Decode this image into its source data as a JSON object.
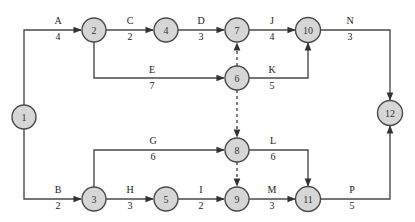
{
  "diagram": {
    "type": "activity-on-arrow network",
    "colors": {
      "node_fill": "#d6d6d6",
      "stroke": "#4a4a4a",
      "text": "#222222"
    },
    "nodes": [
      {
        "id": "1",
        "label": "1",
        "x": 24,
        "y": 117
      },
      {
        "id": "2",
        "label": "2",
        "x": 94,
        "y": 30
      },
      {
        "id": "3",
        "label": "3",
        "x": 94,
        "y": 199
      },
      {
        "id": "4",
        "label": "4",
        "x": 166,
        "y": 30
      },
      {
        "id": "5",
        "label": "5",
        "x": 166,
        "y": 199
      },
      {
        "id": "6",
        "label": "6",
        "x": 237,
        "y": 78
      },
      {
        "id": "7",
        "label": "7",
        "x": 237,
        "y": 30
      },
      {
        "id": "8",
        "label": "8",
        "x": 237,
        "y": 150
      },
      {
        "id": "9",
        "label": "9",
        "x": 237,
        "y": 199
      },
      {
        "id": "10",
        "label": "10",
        "x": 308,
        "y": 30
      },
      {
        "id": "11",
        "label": "11",
        "x": 308,
        "y": 199
      },
      {
        "id": "12",
        "label": "12",
        "x": 390,
        "y": 113
      }
    ],
    "activities": [
      {
        "name": "A",
        "duration": "4",
        "from": "1",
        "to": "2",
        "label_x": 58,
        "name_y": 24,
        "dur_y": 40
      },
      {
        "name": "B",
        "duration": "2",
        "from": "1",
        "to": "3",
        "label_x": 58,
        "name_y": 193,
        "dur_y": 209
      },
      {
        "name": "C",
        "duration": "2",
        "from": "2",
        "to": "4",
        "label_x": 130,
        "name_y": 24,
        "dur_y": 40
      },
      {
        "name": "D",
        "duration": "3",
        "from": "4",
        "to": "7",
        "label_x": 201,
        "name_y": 24,
        "dur_y": 40
      },
      {
        "name": "E",
        "duration": "7",
        "from": "2",
        "to": "6",
        "label_x": 152,
        "name_y": 73,
        "dur_y": 89
      },
      {
        "name": "G",
        "duration": "6",
        "from": "3",
        "to": "8",
        "label_x": 153,
        "name_y": 144,
        "dur_y": 160
      },
      {
        "name": "H",
        "duration": "3",
        "from": "3",
        "to": "5",
        "label_x": 130,
        "name_y": 193,
        "dur_y": 209
      },
      {
        "name": "I",
        "duration": "2",
        "from": "5",
        "to": "9",
        "label_x": 201,
        "name_y": 193,
        "dur_y": 209
      },
      {
        "name": "J",
        "duration": "4",
        "from": "7",
        "to": "10",
        "label_x": 272,
        "name_y": 24,
        "dur_y": 40
      },
      {
        "name": "K",
        "duration": "5",
        "from": "6",
        "to": "10",
        "label_x": 272,
        "name_y": 73,
        "dur_y": 89
      },
      {
        "name": "L",
        "duration": "6",
        "from": "8",
        "to": "11",
        "label_x": 273,
        "name_y": 144,
        "dur_y": 160
      },
      {
        "name": "M",
        "duration": "3",
        "from": "9",
        "to": "11",
        "label_x": 272,
        "name_y": 193,
        "dur_y": 209
      },
      {
        "name": "N",
        "duration": "3",
        "from": "10",
        "to": "12",
        "label_x": 350,
        "name_y": 24,
        "dur_y": 40
      },
      {
        "name": "P",
        "duration": "5",
        "from": "11",
        "to": "12",
        "label_x": 352,
        "name_y": 193,
        "dur_y": 209
      }
    ],
    "dummies": [
      {
        "from": "6",
        "to": "7"
      },
      {
        "from": "6",
        "to": "8"
      },
      {
        "from": "8",
        "to": "9"
      }
    ]
  }
}
